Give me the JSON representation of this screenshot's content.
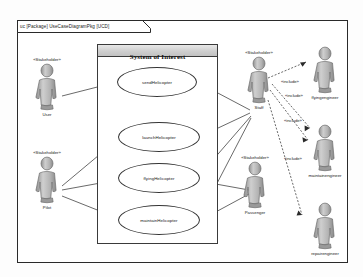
{
  "diagram": {
    "frame_tab_label": "uc [Package] UseCaseDiagramPkg [UCD]",
    "system_boundary_title": "System of Interest",
    "stereotype_stakeholder": "«Stakeholder»",
    "stereotype_include": "«include»"
  },
  "use_cases": [
    {
      "id": "uc1",
      "label": "sendHelicopter"
    },
    {
      "id": "uc2",
      "label": "launchHelicopter"
    },
    {
      "id": "uc3",
      "label": "flyingHelicopter"
    },
    {
      "id": "uc4",
      "label": "maintainHelicopter"
    }
  ],
  "actors": [
    {
      "id": "a1",
      "stereotype": "«Stakeholder»",
      "name": "User"
    },
    {
      "id": "a2",
      "stereotype": "«Stakeholder»",
      "name": "Pilot"
    },
    {
      "id": "a3",
      "stereotype": "«Stakeholder»",
      "name": "Staff"
    },
    {
      "id": "a4",
      "stereotype": "«Stakeholder»",
      "name": "Passenger"
    },
    {
      "id": "a5",
      "stereotype": "",
      "name": "flyingengineer"
    },
    {
      "id": "a6",
      "stereotype": "",
      "name": "maintainengineer"
    },
    {
      "id": "a7",
      "stereotype": "",
      "name": "repairengineer"
    }
  ],
  "include_labels": [
    {
      "id": "inc1",
      "label": "«include»"
    },
    {
      "id": "inc2",
      "label": "«include»"
    },
    {
      "id": "inc3",
      "label": "«include»"
    },
    {
      "id": "inc4",
      "label": "«include»"
    }
  ],
  "colors": {
    "line": "#2a2a2a",
    "actor_fill": "#b9b9b9",
    "header_fill": "#cfcfcf",
    "background": "#ffffff"
  }
}
